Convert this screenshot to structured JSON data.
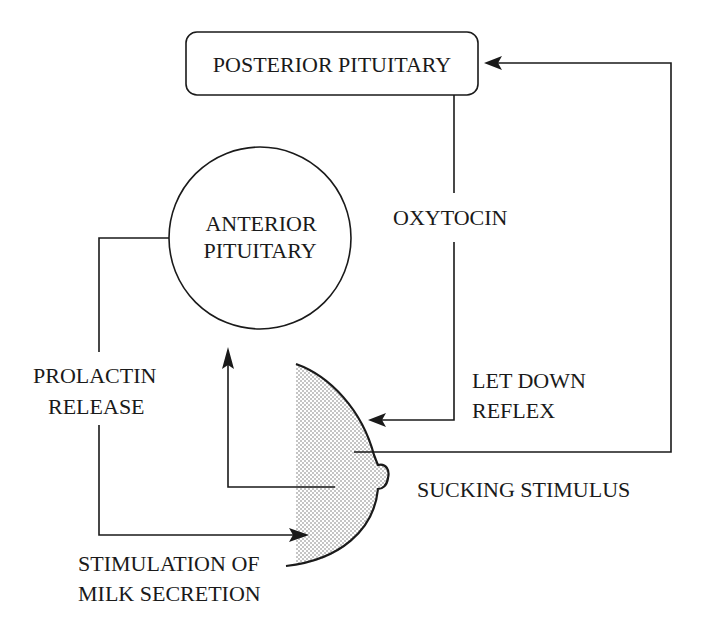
{
  "diagram": {
    "title": "",
    "nodes": {
      "posterior_pituitary": {
        "label": "POSTERIOR PITUITARY",
        "shape": "rounded-rectangle"
      },
      "anterior_pituitary": {
        "line1": "ANTERIOR",
        "line2": "PITUITARY",
        "shape": "circle"
      },
      "breast": {
        "shape": "stippled-breast-profile"
      }
    },
    "labels": {
      "oxytocin": "OXYTOCIN",
      "prolactin_line1": "PROLACTIN",
      "prolactin_line2": "RELEASE",
      "let_down_line1": "LET DOWN",
      "let_down_line2": "REFLEX",
      "sucking_stimulus": "SUCKING STIMULUS",
      "stimulation_line1": "STIMULATION OF",
      "stimulation_line2": "MILK SECRETION"
    },
    "edges": [
      {
        "from": "breast",
        "to": "posterior_pituitary",
        "label": "SUCKING STIMULUS"
      },
      {
        "from": "posterior_pituitary",
        "to": "breast",
        "label": "OXYTOCIN / LET DOWN REFLEX"
      },
      {
        "from": "breast",
        "to": "anterior_pituitary",
        "label": ""
      },
      {
        "from": "anterior_pituitary",
        "to": "breast",
        "label": "PROLACTIN RELEASE / STIMULATION OF MILK SECRETION"
      }
    ],
    "colors": {
      "ink": "#1a1a1a",
      "stipple": "#8a8a8a",
      "background": "#ffffff"
    }
  }
}
